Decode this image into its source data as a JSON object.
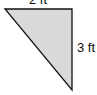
{
  "figure": {
    "shape": "right-triangle",
    "fill": "#d9d9d9",
    "stroke": "#111111",
    "top_side_label": "2 ft",
    "right_side_label": "3 ft"
  }
}
